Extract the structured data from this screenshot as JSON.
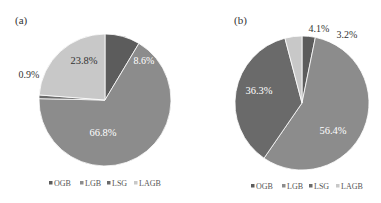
{
  "chart_data": [
    {
      "type": "pie",
      "title": "(a)",
      "categories": [
        "OGB",
        "LGB",
        "LSG",
        "LAGB"
      ],
      "values": [
        8.6,
        66.8,
        0.9,
        23.8
      ],
      "labels": [
        "8.6%",
        "66.8%",
        "0.9%",
        "23.8%"
      ],
      "colors": [
        "#5c5c5c",
        "#8c8c8c",
        "#6a6a6a",
        "#c8c8c8"
      ],
      "label_colors": [
        "#ffffff",
        "#ffffff",
        "#333333",
        "#333333"
      ],
      "legend_position": "bottom",
      "start_angle_deg": 0,
      "direction": "clockwise"
    },
    {
      "type": "pie",
      "title": "(b)",
      "categories": [
        "OGB",
        "LGB",
        "LSG",
        "LAGB"
      ],
      "values": [
        3.2,
        56.4,
        36.3,
        4.1
      ],
      "labels": [
        "3.2%",
        "56.4%",
        "36.3%",
        "4.1%"
      ],
      "colors": [
        "#5c5c5c",
        "#8c8c8c",
        "#6a6a6a",
        "#c8c8c8"
      ],
      "label_colors": [
        "#333333",
        "#ffffff",
        "#ffffff",
        "#333333"
      ],
      "legend_position": "bottom",
      "start_angle_deg": 0,
      "direction": "clockwise"
    }
  ],
  "panels": [
    {
      "tag": "(a)",
      "legend": [
        {
          "label": "OGB",
          "color": "#5c5c5c"
        },
        {
          "label": "LGB",
          "color": "#8c8c8c"
        },
        {
          "label": "LSG",
          "color": "#6a6a6a"
        },
        {
          "label": "LAGB",
          "color": "#c8c8c8"
        }
      ],
      "slice_labels": {
        "ogb": "8.6%",
        "lgb": "66.8%",
        "lsg": "0.9%",
        "lagb": "23.8%"
      }
    },
    {
      "tag": "(b)",
      "legend": [
        {
          "label": "OGB",
          "color": "#5c5c5c"
        },
        {
          "label": "LGB",
          "color": "#8c8c8c"
        },
        {
          "label": "LSG",
          "color": "#6a6a6a"
        },
        {
          "label": "LAGB",
          "color": "#c8c8c8"
        }
      ],
      "slice_labels": {
        "ogb": "3.2%",
        "lgb": "56.4%",
        "lsg": "36.3%",
        "lagb": "4.1%"
      }
    }
  ]
}
